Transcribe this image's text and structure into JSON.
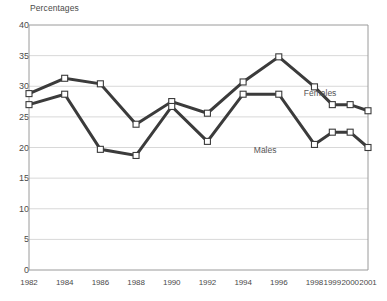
{
  "chart_data": {
    "type": "line",
    "title": "",
    "ylabel": "Percentages",
    "xlabel": "",
    "ylim": [
      0,
      40
    ],
    "ytick_step": 5,
    "yticks": [
      "0",
      "5",
      "10",
      "15",
      "20",
      "25",
      "30",
      "35",
      "40"
    ],
    "grid": true,
    "legend_position": "inline-right",
    "categories": [
      "1982",
      "1984",
      "1986",
      "1988",
      "1990",
      "1992",
      "1994",
      "1996",
      "1998",
      "1999",
      "2000",
      "2001"
    ],
    "series": [
      {
        "name": "Females",
        "color": "#3b3b3b",
        "marker": "open-square",
        "values": [
          28.8,
          31.3,
          30.4,
          23.8,
          27.5,
          25.6,
          30.7,
          34.8,
          29.9,
          27.0,
          27.0,
          26.0
        ]
      },
      {
        "name": "Males",
        "color": "#3b3b3b",
        "marker": "open-square",
        "values": [
          27.0,
          28.7,
          19.7,
          18.7,
          26.7,
          21.0,
          28.7,
          28.7,
          20.5,
          22.5,
          22.5,
          20.0
        ]
      }
    ],
    "annotations": [
      {
        "text": "Females",
        "x_value": 1997.4,
        "y_value": 28.9
      },
      {
        "text": "Males",
        "x_value": 1994.6,
        "y_value": 19.6
      }
    ]
  },
  "colors": {
    "line": "#3b3b3b",
    "grid": "#d8d8d8",
    "axis": "#9a9a9a",
    "text": "#4a4a4a",
    "marker_fill": "#ffffff",
    "background": "#ffffff"
  }
}
